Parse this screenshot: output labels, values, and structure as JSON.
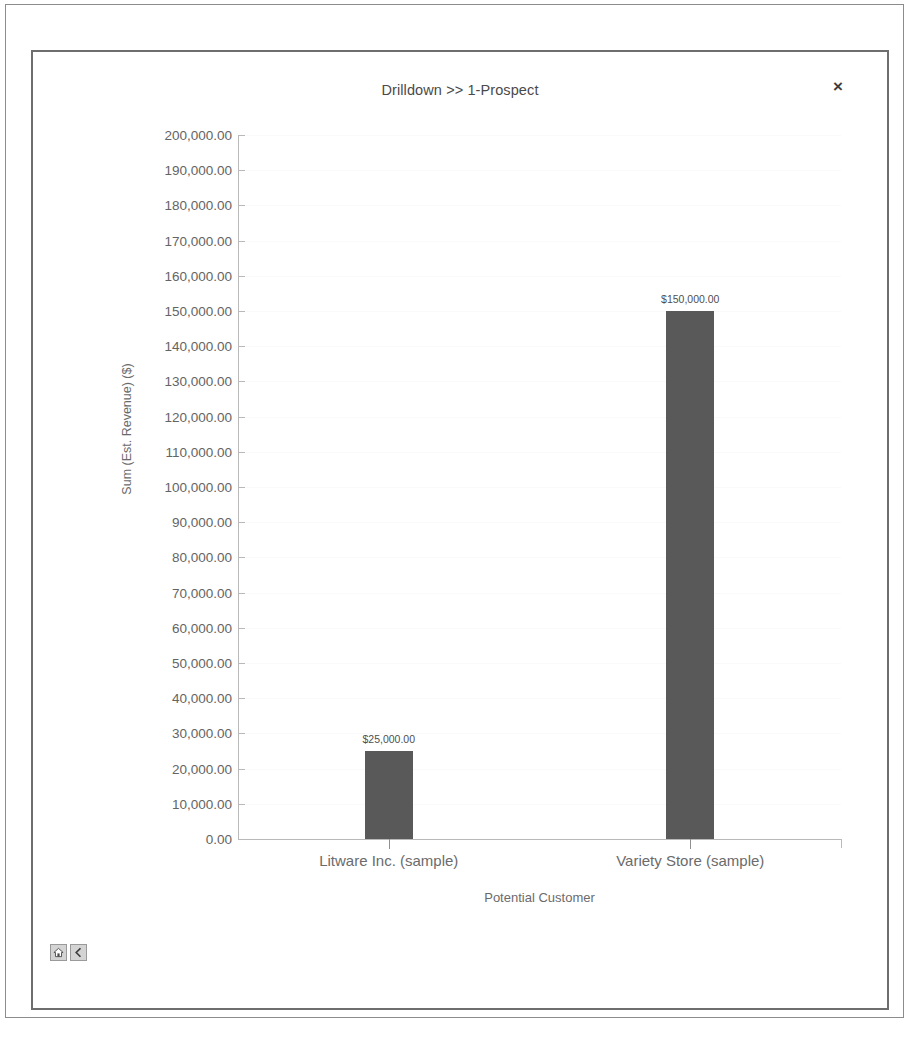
{
  "window": {
    "title": "Drilldown >> 1-Prospect",
    "close_label": "×"
  },
  "nav": {
    "home_icon": "home-icon",
    "back_icon": "back-chevron-icon"
  },
  "chart_data": {
    "type": "bar",
    "title": "Drilldown >> 1-Prospect",
    "xlabel": "Potential Customer",
    "ylabel": "Sum (Est. Revenue) ($)",
    "categories": [
      "Litware Inc. (sample)",
      "Variety Store (sample)"
    ],
    "values": [
      25000,
      150000
    ],
    "data_labels": [
      "$25,000.00",
      "$150,000.00"
    ],
    "ylim": [
      0,
      200000
    ],
    "ytick_values": [
      200000,
      190000,
      180000,
      170000,
      160000,
      150000,
      140000,
      130000,
      120000,
      110000,
      100000,
      90000,
      80000,
      70000,
      60000,
      50000,
      40000,
      30000,
      20000,
      10000,
      0
    ],
    "ytick_labels": [
      "200,000.00",
      "190,000.00",
      "180,000.00",
      "170,000.00",
      "160,000.00",
      "150,000.00",
      "140,000.00",
      "130,000.00",
      "120,000.00",
      "110,000.00",
      "100,000.00",
      "90,000.00",
      "80,000.00",
      "70,000.00",
      "60,000.00",
      "50,000.00",
      "40,000.00",
      "30,000.00",
      "20,000.00",
      "10,000.00",
      "0.00"
    ],
    "grid": true,
    "legend": "none",
    "bar_color": "#595959"
  }
}
